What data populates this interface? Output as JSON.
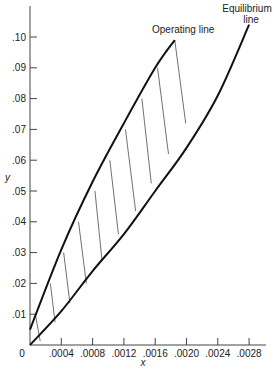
{
  "chart_data": {
    "type": "line",
    "title": "",
    "xlabel": "x",
    "ylabel": "y",
    "xlim": [
      0,
      0.003
    ],
    "ylim": [
      0,
      0.11
    ],
    "grid": false,
    "x_ticks": [
      "0",
      ".0004",
      ".0008",
      ".0012",
      ".0016",
      ".0020",
      ".0024",
      ".0028"
    ],
    "y_ticks": [
      ".01",
      ".02",
      ".03",
      ".04",
      ".05",
      ".06",
      ".07",
      ".08",
      ".09",
      ".10"
    ],
    "series": [
      {
        "name": "Operating line",
        "x": [
          0.0,
          0.0004,
          0.0008,
          0.0012,
          0.0016,
          0.00185
        ],
        "y": [
          0.005,
          0.031,
          0.053,
          0.072,
          0.09,
          0.099
        ]
      },
      {
        "name": "Equilibrium line",
        "x": [
          0.0,
          0.0004,
          0.0008,
          0.0012,
          0.0016,
          0.002,
          0.0024,
          0.0028
        ],
        "y": [
          0.0,
          0.011,
          0.024,
          0.036,
          0.05,
          0.064,
          0.081,
          0.104
        ]
      }
    ],
    "tie_lines": [
      {
        "from": [
          7e-05,
          0.0097
        ],
        "to": [
          0.00013,
          0.0013
        ]
      },
      {
        "from": [
          0.00026,
          0.02
        ],
        "to": [
          0.00032,
          0.0074
        ]
      },
      {
        "from": [
          0.00043,
          0.03
        ],
        "to": [
          0.00051,
          0.0136
        ]
      },
      {
        "from": [
          0.00062,
          0.04
        ],
        "to": [
          0.00072,
          0.02
        ]
      },
      {
        "from": [
          0.00083,
          0.05
        ],
        "to": [
          0.00092,
          0.0275
        ]
      },
      {
        "from": [
          0.00102,
          0.06
        ],
        "to": [
          0.00113,
          0.036
        ]
      },
      {
        "from": [
          0.00122,
          0.07
        ],
        "to": [
          0.00135,
          0.0435
        ]
      },
      {
        "from": [
          0.00143,
          0.08
        ],
        "to": [
          0.00155,
          0.0525
        ]
      },
      {
        "from": [
          0.00163,
          0.09
        ],
        "to": [
          0.00177,
          0.062
        ]
      },
      {
        "from": [
          0.00185,
          0.099
        ],
        "to": [
          0.00199,
          0.072
        ]
      }
    ],
    "annotations": [
      "Operating line",
      "Equilibrium line"
    ],
    "legend": "none"
  },
  "labels": {
    "operating_line": "Operating line",
    "equilibrium_line_1": "Equilibrium",
    "equilibrium_line_2": "line",
    "x_axis": "x",
    "y_axis": "y",
    "origin": "0"
  }
}
